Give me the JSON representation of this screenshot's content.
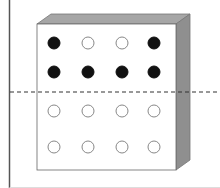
{
  "diagram": {
    "colors": {
      "background": "#ffffff",
      "frame_line": "#555555",
      "box_face": "#ffffff",
      "box_edge": "#666666",
      "box_top": "#a6a6a6",
      "box_side": "#8f8f8f",
      "filled_circle": "#111111",
      "empty_circle_stroke": "#888888",
      "dashed_line": "#333333"
    },
    "grid": {
      "columns": [
        54,
        88,
        122,
        154
      ],
      "rows": [
        43,
        72,
        111,
        147
      ],
      "radius": 6,
      "states": [
        [
          "filled",
          "empty",
          "empty",
          "filled"
        ],
        [
          "filled",
          "filled",
          "filled",
          "filled"
        ],
        [
          "empty",
          "empty",
          "empty",
          "empty"
        ],
        [
          "empty",
          "empty",
          "empty",
          "empty"
        ]
      ]
    },
    "dashed_line_y": 92
  }
}
